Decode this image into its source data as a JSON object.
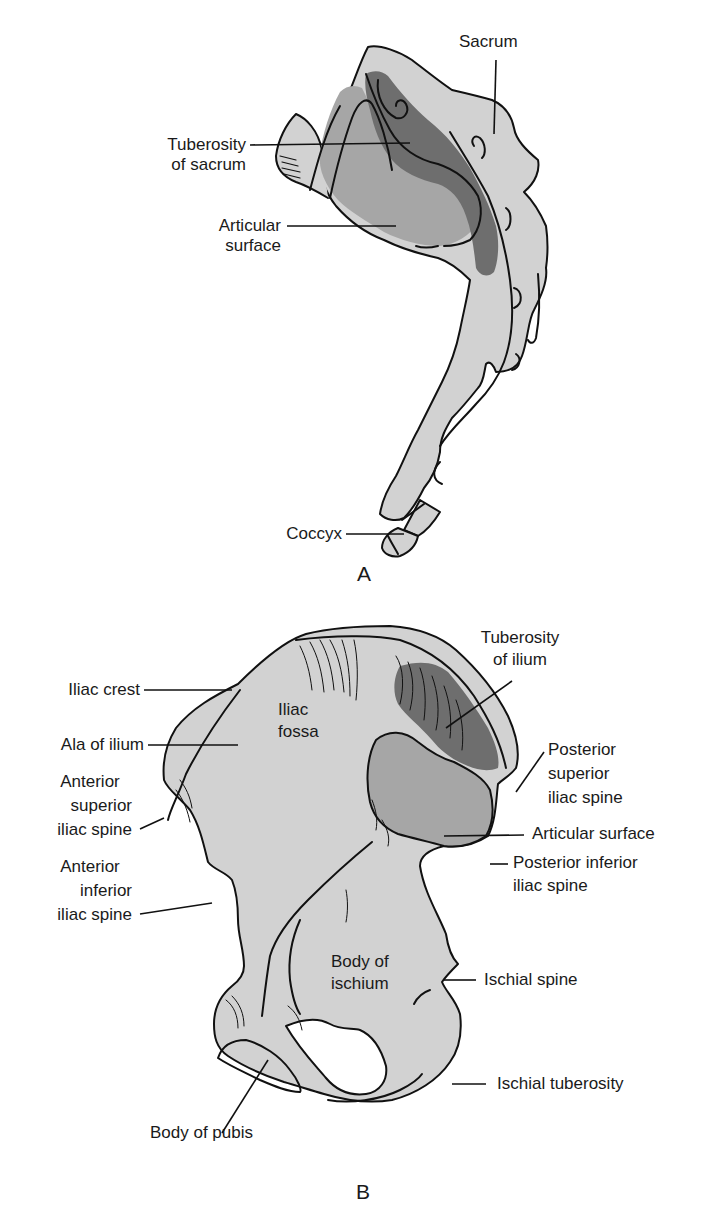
{
  "colors": {
    "bone_light": "#d2d2d2",
    "articular_medium": "#a6a6a6",
    "tuberosity_dark": "#6e6e6e",
    "outline": "#111111",
    "background": "#ffffff"
  },
  "panel_a": {
    "letter": "A",
    "structure": "Sacrum and coccyx, lateral view",
    "labels": {
      "sacrum": "Sacrum",
      "tuberosity_line1": "Tuberosity",
      "tuberosity_line2": "of sacrum",
      "articular_line1": "Articular",
      "articular_line2": "surface",
      "coccyx": "Coccyx"
    }
  },
  "panel_b": {
    "letter": "B",
    "structure": "Hip bone, medial view",
    "labels": {
      "iliac_crest": "Iliac crest",
      "ala_of_ilium": "Ala of ilium",
      "asis_line1": "Anterior",
      "asis_line2": "superior",
      "asis_line3": "iliac spine",
      "aiis_line1": "Anterior",
      "aiis_line2": "inferior",
      "aiis_line3": "iliac spine",
      "iliac_fossa_line1": "Iliac",
      "iliac_fossa_line2": "fossa",
      "tuberosity_line1": "Tuberosity",
      "tuberosity_line2": "of ilium",
      "psis_line1": "Posterior",
      "psis_line2": "superior",
      "psis_line3": "iliac spine",
      "articular_surface": "Articular surface",
      "piis_line1": "Posterior inferior",
      "piis_line2": "iliac spine",
      "body_ischium_line1": "Body of",
      "body_ischium_line2": "ischium",
      "ischial_spine": "Ischial spine",
      "ischial_tuberosity": "Ischial tuberosity",
      "body_of_pubis": "Body of pubis"
    }
  }
}
